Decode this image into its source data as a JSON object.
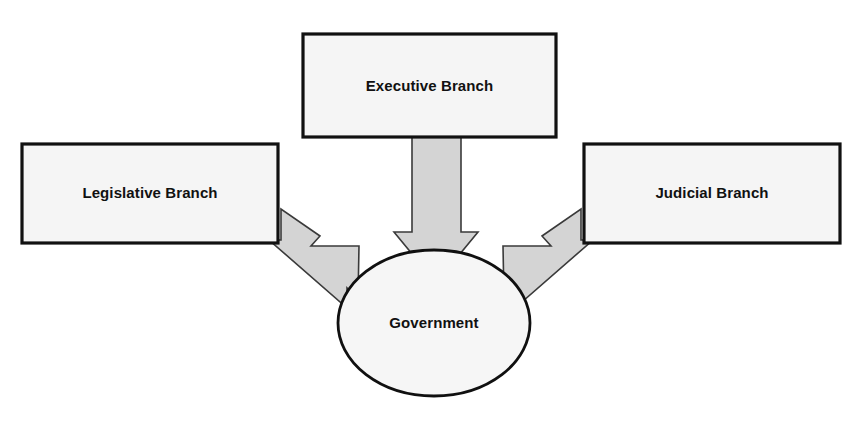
{
  "diagram": {
    "nodes": [
      {
        "id": "executive",
        "label": "Executive Branch",
        "shape": "rectangle",
        "x": 303,
        "y": 34,
        "width": 253,
        "height": 103
      },
      {
        "id": "legislative",
        "label": "Legislative Branch",
        "shape": "rectangle",
        "x": 22,
        "y": 144,
        "width": 256,
        "height": 99
      },
      {
        "id": "judicial",
        "label": "Judicial Branch",
        "shape": "rectangle",
        "x": 584,
        "y": 144,
        "width": 256,
        "height": 99
      },
      {
        "id": "government",
        "label": "Government",
        "shape": "ellipse",
        "cx": 434,
        "cy": 323,
        "rx": 96,
        "ry": 73
      }
    ],
    "edges": [
      {
        "id": "executive-to-government",
        "from": "executive",
        "to": "government",
        "direction": "down",
        "style": "block-arrow"
      },
      {
        "id": "legislative-to-government",
        "from": "legislative",
        "to": "government",
        "direction": "down-right",
        "style": "block-arrow"
      },
      {
        "id": "judicial-to-government",
        "from": "judicial",
        "to": "government",
        "direction": "down-left",
        "style": "block-arrow"
      }
    ],
    "colors": {
      "background": "#ffffff",
      "box_fill": "#f5f5f5",
      "box_stroke": "#111111",
      "ellipse_fill": "#f6f6f6",
      "ellipse_stroke": "#101010",
      "arrow_fill": "#d4d4d4",
      "arrow_stroke": "#3a3a3a",
      "text": "#111111"
    }
  }
}
